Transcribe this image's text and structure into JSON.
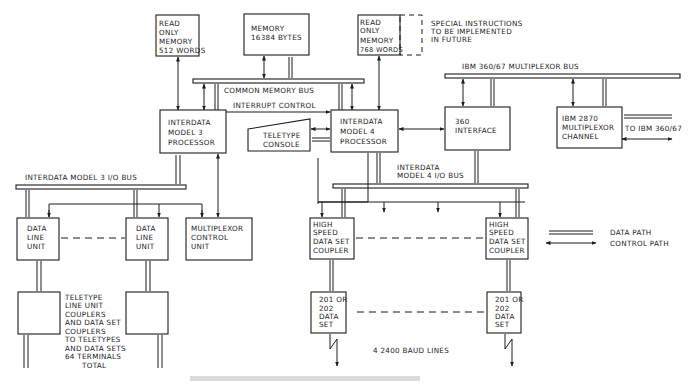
{
  "colors": {
    "ink": "#1c1c1c",
    "background": "#ffffff",
    "caption": "#b8b8b8"
  },
  "blocks": {
    "rom512": [
      "READ",
      "ONLY",
      "MEMORY",
      "512 WORDS"
    ],
    "memory": [
      "MEMORY",
      "16384 BYTES"
    ],
    "rom768": [
      "READ",
      "ONLY",
      "MEMORY",
      "768 WORDS"
    ],
    "special": [
      "SPECIAL INSTRUCTIONS",
      "TO BE IMPLEMENTED",
      "IN FUTURE"
    ],
    "model3": [
      "INTERDATA",
      "MODEL 3",
      "PROCESSOR"
    ],
    "model4": [
      "INTERDATA",
      "MODEL 4",
      "PROCESSOR"
    ],
    "teletype_console": [
      "TELETYPE",
      "CONSOLE"
    ],
    "interface360": [
      "360",
      "INTERFACE"
    ],
    "ibm2870": [
      "IBM 2870",
      "MULTIPLEXOR",
      "CHANNEL"
    ],
    "dlu1": [
      "DATA",
      "LINE",
      "UNIT"
    ],
    "dlu2": [
      "DATA",
      "LINE",
      "UNIT"
    ],
    "mcu": [
      "MULTIPLEXOR",
      "CONTROL",
      "UNIT"
    ],
    "hsdsc1": [
      "HIGH",
      "SPEED",
      "DATA SET",
      "COUPLER"
    ],
    "hsdsc2": [
      "HIGH",
      "SPEED",
      "DATA SET",
      "COUPLER"
    ],
    "ds1": [
      "201 OR",
      "202",
      "DATA",
      "SET"
    ],
    "ds2": [
      "201 OR",
      "202",
      "DATA",
      "SET"
    ],
    "couplers_note": [
      "TELETYPE",
      "LINE UNIT",
      "COUPLERS",
      "AND DATA SET",
      "COUPLERS",
      "TO TELETYPES",
      "AND DATA SETS",
      "64 TERMINALS",
      "TOTAL"
    ]
  },
  "buses": {
    "common_memory": "COMMON MEMORY BUS",
    "interrupt_control": "INTERRUPT CONTROL",
    "ibm_mux": "IBM 360/67 MULTIPLEXOR BUS",
    "model3_io": "INTERDATA MODEL 3  I/O BUS",
    "model4_io_1": "INTERDATA",
    "model4_io_2": "MODEL 4  I/O BUS"
  },
  "labels": {
    "to_ibm": "TO IBM 360/67",
    "baud_lines": "4 2400 BAUD LINES"
  },
  "legend": {
    "data_path": "DATA PATH",
    "control_path": "CONTROL PATH"
  }
}
